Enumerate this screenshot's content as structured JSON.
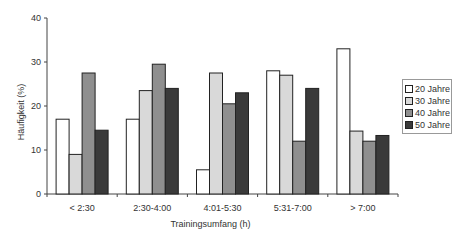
{
  "chart_data": {
    "type": "bar",
    "title": "",
    "xlabel": "Trainingsumfang (h)",
    "ylabel": "Häufigkeit (%)",
    "ylim": [
      0,
      40
    ],
    "yticks": [
      0,
      10,
      20,
      30,
      40
    ],
    "grid": false,
    "legend_position": "right",
    "categories": [
      "< 2:30",
      "2:30-4:00",
      "4:01-5:30",
      "5:31-7:00",
      "> 7:00"
    ],
    "series": [
      {
        "name": "20 Jahre",
        "color": "#ffffff",
        "values": [
          17,
          17,
          5.5,
          28,
          33
        ]
      },
      {
        "name": "30 Jahre",
        "color": "#d9d9d9",
        "values": [
          9,
          23.5,
          27.5,
          27,
          14.3
        ]
      },
      {
        "name": "40 Jahre",
        "color": "#8f8f8f",
        "values": [
          27.5,
          29.5,
          20.5,
          12,
          12
        ]
      },
      {
        "name": "50 Jahre",
        "color": "#3a3a3a",
        "values": [
          14.5,
          24,
          23,
          24,
          13.3
        ]
      }
    ]
  }
}
